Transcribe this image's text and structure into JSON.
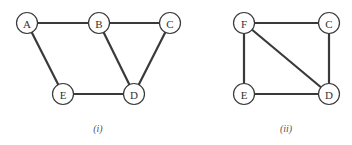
{
  "graphs": [
    {
      "caption": "(i)",
      "caption_pos": [
        98,
        128
      ],
      "nodes": [
        {
          "id": "A",
          "label": "A",
          "x": 27,
          "y": 23
        },
        {
          "id": "B",
          "label": "B",
          "x": 99,
          "y": 23
        },
        {
          "id": "C",
          "label": "C",
          "x": 170,
          "y": 23
        },
        {
          "id": "E",
          "label": "E",
          "x": 63,
          "y": 94
        },
        {
          "id": "D",
          "label": "D",
          "x": 134,
          "y": 94
        }
      ],
      "edges": [
        [
          "A",
          "B"
        ],
        [
          "B",
          "C"
        ],
        [
          "A",
          "E"
        ],
        [
          "B",
          "D"
        ],
        [
          "C",
          "D"
        ],
        [
          "E",
          "D"
        ]
      ]
    },
    {
      "caption": "(ii)",
      "caption_pos": [
        286,
        128
      ],
      "nodes": [
        {
          "id": "F",
          "label": "F",
          "x": 244,
          "y": 23
        },
        {
          "id": "C",
          "label": "C",
          "x": 329,
          "y": 23
        },
        {
          "id": "E",
          "label": "E",
          "x": 244,
          "y": 94
        },
        {
          "id": "D",
          "label": "D",
          "x": 329,
          "y": 94
        }
      ],
      "edges": [
        [
          "F",
          "C"
        ],
        [
          "F",
          "E"
        ],
        [
          "F",
          "D"
        ],
        [
          "C",
          "D"
        ],
        [
          "E",
          "D"
        ]
      ]
    }
  ],
  "style": {
    "node_radius": 10.5,
    "edge_color": "#3a3a3a",
    "background": "#ffffff"
  }
}
